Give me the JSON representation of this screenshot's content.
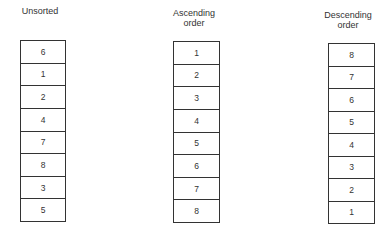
{
  "columns": [
    {
      "title_lines": [
        "Unsorted"
      ],
      "values": [
        "6",
        "1",
        "2",
        "4",
        "7",
        "8",
        "3",
        "5"
      ]
    },
    {
      "title_lines": [
        "Ascending",
        "order"
      ],
      "values": [
        "1",
        "2",
        "3",
        "4",
        "5",
        "6",
        "7",
        "8"
      ]
    },
    {
      "title_lines": [
        "Descending",
        "order"
      ],
      "values": [
        "8",
        "7",
        "6",
        "5",
        "4",
        "3",
        "2",
        "1"
      ]
    }
  ]
}
